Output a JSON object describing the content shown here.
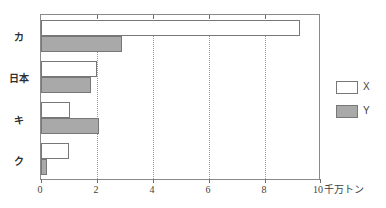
{
  "chart_data": {
    "type": "bar",
    "orientation": "horizontal",
    "title": "",
    "xlabel": "千万トン",
    "ylabel": "",
    "xlim": [
      0,
      10
    ],
    "xticks": [
      0,
      2,
      4,
      6,
      8,
      10
    ],
    "xtick_labels": [
      "0",
      "2",
      "4",
      "6",
      "8",
      "10"
    ],
    "grid": "vertical-dotted",
    "legend_position": "right",
    "categories": [
      "カ",
      "日本",
      "キ",
      "ク"
    ],
    "series": [
      {
        "name": "X",
        "color": "#ffffff",
        "values": [
          9.3,
          2.0,
          1.05,
          1.0
        ]
      },
      {
        "name": "Y",
        "color": "#a9a9a9",
        "values": [
          2.9,
          1.8,
          2.1,
          0.2
        ]
      }
    ]
  },
  "legend": {
    "entries": [
      {
        "label": "X",
        "swatch": "white-swatch"
      },
      {
        "label": "Y",
        "swatch": "gray-swatch"
      }
    ]
  },
  "axis": {
    "unit_label": "千万トン"
  }
}
